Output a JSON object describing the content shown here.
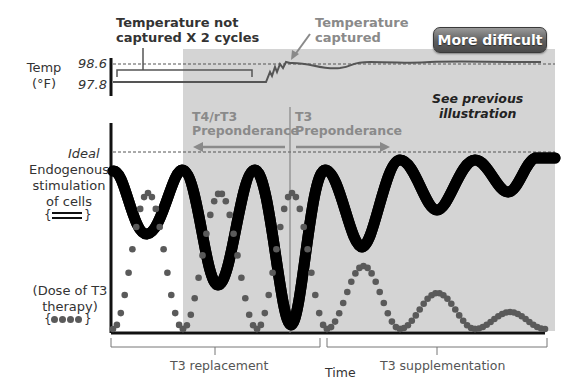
{
  "badge": {
    "label": "More difficult"
  },
  "temperature_panel": {
    "axis_label_line1": "Temp",
    "axis_label_line2": "(°F)",
    "tick_high": "98.6",
    "tick_low": "97.8",
    "annotation_not_captured_line1": "Temperature not",
    "annotation_not_captured_line2": "captured X 2 cycles",
    "annotation_captured_line1": "Temperature",
    "annotation_captured_line2": "captured"
  },
  "main_panel": {
    "ideal_label": "Ideal",
    "endogenous_label_line1": "Endogenous",
    "endogenous_label_line2": "stimulation",
    "endogenous_label_line3": "of cells",
    "endogenous_legend": "{═══}",
    "dose_label_line1": "(Dose of T3",
    "dose_label_line2": "therapy)",
    "dose_legend": "{●●●●}",
    "t4_label_line1": "T4/rT3",
    "t4_label_line2": "Preponderance",
    "t3_label_line1": "T3",
    "t3_label_line2": "Preponderance",
    "see_previous_line1": "See previous",
    "see_previous_line2": "illustration"
  },
  "x_axis": {
    "label": "Time",
    "phase_1": "T3 replacement",
    "phase_2": "T3 supplementation"
  },
  "colors": {
    "shaded_region": "#d4d4d4",
    "temperature_line": "#555555",
    "dose_dots": "#5a5a5a",
    "annotation_gray": "#8a8a8a",
    "badge": "#5e5e5e"
  }
}
